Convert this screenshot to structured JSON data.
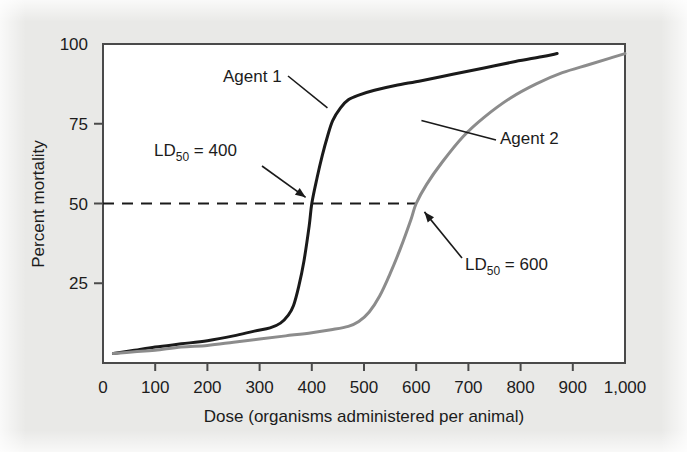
{
  "figure": {
    "background_color": "#e9e9e7",
    "plot_background_color": "#ffffff",
    "frame_color": "#4a4a4a"
  },
  "chart_data": {
    "type": "line",
    "title": "",
    "subtitle": "",
    "xlabel": "Dose (organisms administered per animal)",
    "ylabel": "Percent mortality",
    "xlim": [
      0,
      1000
    ],
    "ylim": [
      0,
      100
    ],
    "grid": false,
    "legend_position": "inline-annotations",
    "xticks": [
      0,
      100,
      200,
      300,
      400,
      500,
      600,
      700,
      800,
      900,
      1000
    ],
    "xticklabels": [
      "0",
      "100",
      "200",
      "300",
      "400",
      "500",
      "600",
      "700",
      "800",
      "900",
      "1,000"
    ],
    "yticks": [
      25,
      50,
      75,
      100
    ],
    "yticklabels": [
      "25",
      "50",
      "75",
      "100"
    ],
    "series": [
      {
        "name": "Agent 1",
        "color": "#1a1a1a",
        "line_width": 3.0,
        "x": [
          20,
          60,
          100,
          150,
          200,
          250,
          290,
          320,
          340,
          355,
          365,
          375,
          385,
          395,
          400,
          410,
          420,
          430,
          440,
          455,
          470,
          490,
          520,
          560,
          610,
          670,
          730,
          790,
          840,
          870
        ],
        "y": [
          3,
          4,
          5,
          6,
          7,
          8.5,
          10,
          11,
          12.5,
          15,
          18,
          24,
          32,
          43,
          50,
          58,
          65,
          71,
          76,
          80,
          82.5,
          84,
          85.5,
          87,
          88.5,
          90.5,
          92.5,
          94.5,
          96,
          97
        ]
      },
      {
        "name": "Agent 2",
        "color": "#8c8c8c",
        "line_width": 3.0,
        "x": [
          20,
          60,
          100,
          150,
          200,
          250,
          300,
          350,
          400,
          440,
          470,
          490,
          510,
          530,
          550,
          570,
          590,
          600,
          620,
          650,
          690,
          730,
          780,
          830,
          880,
          930,
          970,
          1000
        ],
        "y": [
          3,
          3.5,
          4,
          5,
          5.5,
          6.5,
          7.5,
          8.5,
          9.5,
          10.5,
          11.5,
          13,
          16,
          21,
          28,
          36,
          45,
          50,
          56,
          63,
          71,
          77,
          83,
          87.5,
          91,
          93.5,
          95.5,
          97
        ]
      }
    ],
    "reference_lines": [
      {
        "name": "ld50-reference-line",
        "orientation": "horizontal",
        "value": 50,
        "style": "dashed",
        "color": "#1a1a1a",
        "x_start": 0,
        "x_end": 600
      }
    ],
    "annotations": [
      {
        "name": "agent-1-label",
        "text": "Agent 1",
        "x": 300,
        "y": 88,
        "points_to_x": 430,
        "points_to_y": 80
      },
      {
        "name": "agent-2-label",
        "text": "Agent 2",
        "x": 700,
        "y": 68,
        "points_to_x": 610,
        "points_to_y": 76
      },
      {
        "name": "ld50-400-label",
        "text_prefix": "LD",
        "text_sub": "50",
        "text_suffix": " = 400",
        "text_full": "LD50 = 400",
        "x": 175,
        "y": 68,
        "points_to_x": 392,
        "points_to_y": 51
      },
      {
        "name": "ld50-600-label",
        "text_prefix": "LD",
        "text_sub": "50",
        "text_suffix": " = 600",
        "text_full": "LD50 = 600",
        "x": 690,
        "y": 28,
        "points_to_x": 610,
        "points_to_y": 48
      }
    ]
  }
}
